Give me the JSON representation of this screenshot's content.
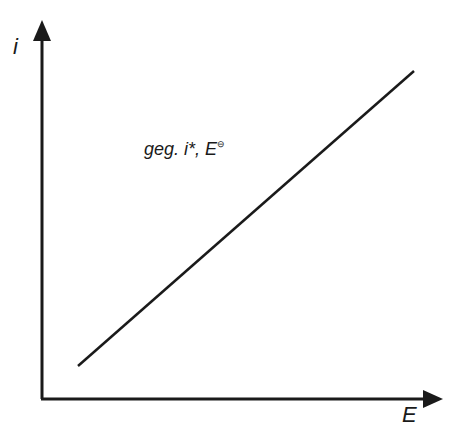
{
  "diagram": {
    "y_axis": {
      "label": "i"
    },
    "x_axis": {
      "label": "E"
    },
    "annotation": {
      "text": "geg. i*, E",
      "superscript": "⊖"
    },
    "line": {
      "x1": 78,
      "y1": 366,
      "x2": 414,
      "y2": 71
    },
    "colors": {
      "stroke": "#1a1a1a",
      "background": "#ffffff"
    }
  }
}
